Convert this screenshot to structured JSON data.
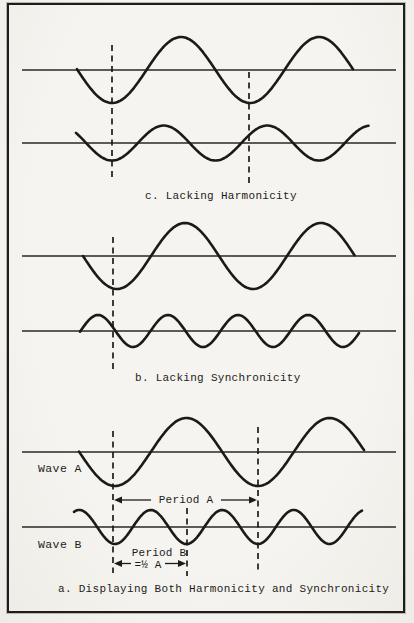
{
  "figure_title": "Harmonicity and Synchronicity of Waves",
  "colors": {
    "paper": "#f5f4f0",
    "ink": "#1b1a18",
    "border": "#1e1d1b"
  },
  "captions": {
    "c": "c. Lacking Harmonicity",
    "b": "b. Lacking Synchronicity",
    "a": "a. Displaying Both Harmonicity and Synchronicity"
  },
  "labels": {
    "wave_a": "Wave A",
    "wave_b": "Wave B",
    "period_a": "Period A",
    "period_b": "Period B",
    "half_a": "=½ A"
  },
  "diagram": {
    "panels": [
      {
        "id": "c",
        "caption_key": "c",
        "axes": [
          {
            "y": 70,
            "x1": 22,
            "x2": 396
          },
          {
            "y": 143,
            "x1": 22,
            "x2": 396
          }
        ],
        "waves": [
          {
            "name": "upper-wave",
            "axis_y": 70,
            "amplitude": 33,
            "trough_x": 112,
            "period": 138,
            "x1": 77,
            "x2": 353
          },
          {
            "name": "lower-wave",
            "axis_y": 143,
            "amplitude": 17.5,
            "trough_x": 112,
            "period": 103.5,
            "x1": 76,
            "x2": 369
          }
        ],
        "dashed_lines": [
          {
            "x": 112,
            "y1": 45,
            "y2": 178
          },
          {
            "x": 249,
            "y1": 72,
            "y2": 185
          }
        ]
      },
      {
        "id": "b",
        "caption_key": "b",
        "axes": [
          {
            "y": 256,
            "x1": 22,
            "x2": 396
          },
          {
            "y": 331,
            "x1": 22,
            "x2": 396
          }
        ],
        "waves": [
          {
            "name": "upper-wave",
            "axis_y": 256,
            "amplitude": 33,
            "trough_x": 117,
            "period": 136,
            "x1": 83,
            "x2": 355
          },
          {
            "name": "lower-wave",
            "axis_y": 331,
            "amplitude": 16,
            "trough_x": 133,
            "period": 70,
            "x1": 80,
            "x2": 360
          }
        ],
        "dashed_lines": [
          {
            "x": 113,
            "y1": 237,
            "y2": 370
          }
        ]
      },
      {
        "id": "a",
        "caption_key": "a",
        "axes": [
          {
            "y": 452,
            "x1": 22,
            "x2": 396
          },
          {
            "y": 527,
            "x1": 22,
            "x2": 396
          }
        ],
        "waves": [
          {
            "name": "wave-A",
            "axis_y": 452,
            "amplitude": 34,
            "trough_x": 115,
            "period": 143,
            "x1": 79,
            "x2": 364
          },
          {
            "name": "wave-B",
            "axis_y": 527,
            "amplitude": 17,
            "trough_x": 115,
            "period": 71.5,
            "x1": 74,
            "x2": 363
          }
        ],
        "dashed_lines": [
          {
            "x": 113,
            "y1": 431,
            "y2": 573
          },
          {
            "x": 258,
            "y1": 427,
            "y2": 573
          },
          {
            "x": 187,
            "y1": 508,
            "y2": 576
          }
        ],
        "arrows": [
          {
            "name": "period-A-span",
            "y": 500,
            "x1": 114,
            "x2": 257,
            "gap": [
              151,
              221
            ]
          },
          {
            "name": "half-A-span",
            "y": 563.5,
            "x1": 114,
            "x2": 186,
            "gap": [
              131,
              165
            ]
          }
        ]
      }
    ]
  }
}
